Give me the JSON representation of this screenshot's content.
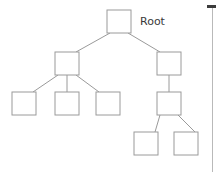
{
  "diagram": {
    "background_color": "#ffffff",
    "node_fill_color": "#ffffff",
    "node_stroke_color": "#9a9a9a",
    "edge_color": "#9a9a9a",
    "label_color": "#3a3a3a"
  },
  "labels": {
    "root": "Root"
  },
  "nodes": [
    {
      "id": "root",
      "label": "Root",
      "x": 107,
      "y": 10,
      "w": 24,
      "h": 23,
      "level": 0
    },
    {
      "id": "n-l",
      "label": "",
      "x": 55,
      "y": 52,
      "w": 24,
      "h": 23,
      "level": 1
    },
    {
      "id": "n-r",
      "label": "",
      "x": 157,
      "y": 52,
      "w": 24,
      "h": 23,
      "level": 1
    },
    {
      "id": "n-l1",
      "label": "",
      "x": 12,
      "y": 92,
      "w": 24,
      "h": 23,
      "level": 2
    },
    {
      "id": "n-l2",
      "label": "",
      "x": 55,
      "y": 92,
      "w": 24,
      "h": 23,
      "level": 2
    },
    {
      "id": "n-l3",
      "label": "",
      "x": 96,
      "y": 92,
      "w": 24,
      "h": 23,
      "level": 2
    },
    {
      "id": "n-r1",
      "label": "",
      "x": 157,
      "y": 92,
      "w": 24,
      "h": 23,
      "level": 2
    },
    {
      "id": "n-r1a",
      "label": "",
      "x": 134,
      "y": 132,
      "w": 24,
      "h": 23,
      "level": 3
    },
    {
      "id": "n-r1b",
      "label": "",
      "x": 174,
      "y": 132,
      "w": 24,
      "h": 23,
      "level": 3
    }
  ],
  "edges": [
    {
      "from": "root",
      "to": "n-l",
      "x1": 110,
      "y1": 33,
      "x2": 76,
      "y2": 52
    },
    {
      "from": "root",
      "to": "n-r",
      "x1": 128,
      "y1": 33,
      "x2": 160,
      "y2": 52
    },
    {
      "from": "n-l",
      "to": "n-l1",
      "x1": 58,
      "y1": 75,
      "x2": 33,
      "y2": 92
    },
    {
      "from": "n-l",
      "to": "n-l2",
      "x1": 67,
      "y1": 75,
      "x2": 67,
      "y2": 92
    },
    {
      "from": "n-l",
      "to": "n-l3",
      "x1": 76,
      "y1": 75,
      "x2": 99,
      "y2": 92
    },
    {
      "from": "n-r",
      "to": "n-r1",
      "x1": 169,
      "y1": 75,
      "x2": 169,
      "y2": 92
    },
    {
      "from": "n-r1",
      "to": "n-r1a",
      "x1": 160,
      "y1": 115,
      "x2": 155,
      "y2": 132
    },
    {
      "from": "n-r1",
      "to": "n-r1b",
      "x1": 178,
      "y1": 115,
      "x2": 195,
      "y2": 132
    }
  ],
  "scrollbar": {
    "name": "vertical-scrollbar",
    "track_color": "#b9b9b9",
    "thumb_color": "#3c3c3c",
    "x": 212,
    "track_top": 5,
    "track_height": 167,
    "thumb_top": 5,
    "thumb_height": 3,
    "thumb_width": 9
  }
}
